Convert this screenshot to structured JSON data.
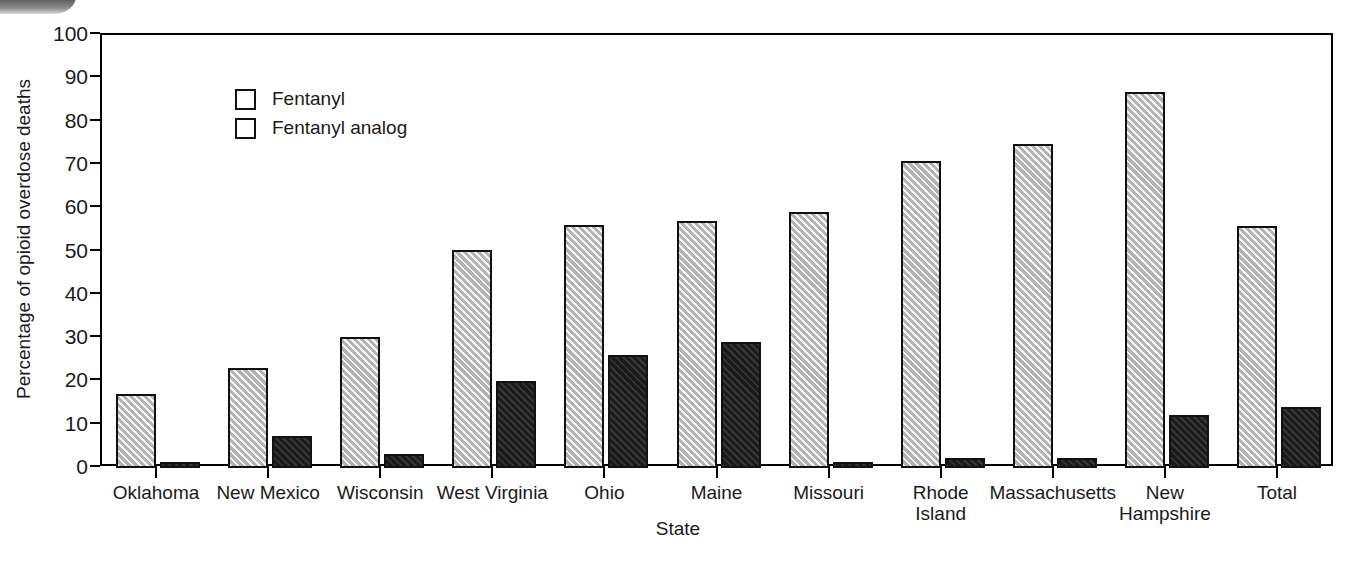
{
  "chart_data": {
    "type": "bar",
    "title": "",
    "xlabel": "State",
    "ylabel": "Percentage of opioid overdose deaths",
    "ylim": [
      0,
      100
    ],
    "yticks": [
      0,
      10,
      20,
      30,
      40,
      50,
      60,
      70,
      80,
      90,
      100
    ],
    "ytick_labels": [
      "0",
      "10",
      "20",
      "30",
      "40",
      "50",
      "60",
      "70",
      "80",
      "90",
      "100"
    ],
    "grid": false,
    "legend_position": "top-left",
    "categories": [
      "Oklahoma",
      "New Mexico",
      "Wisconsin",
      "West Virginia",
      "Ohio",
      "Maine",
      "Missouri",
      "Rhode\nIsland",
      "Massachusetts",
      "New\nHampshire",
      "Total"
    ],
    "series": [
      {
        "name": "Fentanyl",
        "color": "#cbcbcb",
        "pattern": "diagonal-hatch",
        "values": [
          17.0,
          23.0,
          30.3,
          50.3,
          56.2,
          57.0,
          59.2,
          71.0,
          74.8,
          86.8,
          55.9
        ]
      },
      {
        "name": "Fentanyl analog",
        "color": "#282828",
        "pattern": "solid-dark",
        "values": [
          1.3,
          7.3,
          3.2,
          20.0,
          26.0,
          29.0,
          1.3,
          2.2,
          2.2,
          12.2,
          14.0
        ]
      }
    ]
  },
  "legend": {
    "entries": [
      {
        "label": "Fentanyl"
      },
      {
        "label": "Fentanyl analog"
      }
    ]
  },
  "axes": {
    "x_title": "State",
    "y_title": "Percentage of opioid overdose deaths"
  }
}
